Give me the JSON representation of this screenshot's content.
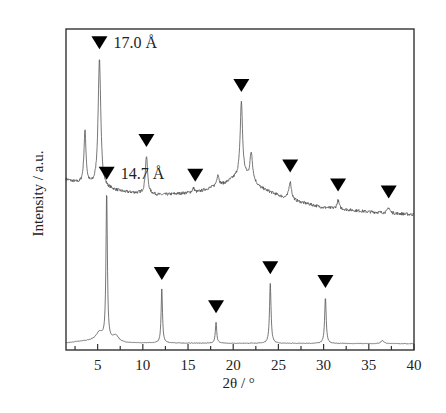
{
  "chart_data": {
    "type": "line",
    "title": "",
    "xlabel": "2θ / °",
    "ylabel": "Intensity / a.u.",
    "xlim": [
      1.5,
      40
    ],
    "x_ticks": [
      5,
      10,
      15,
      20,
      25,
      30,
      35,
      40
    ],
    "x_minor_step": 2.5,
    "y_ticks": [],
    "grid": false,
    "legend": null,
    "marker_symbol": "▼",
    "series": [
      {
        "name": "upper pattern",
        "offset": 1.0,
        "baseline": [
          [
            1.5,
            0.36
          ],
          [
            3,
            0.33
          ],
          [
            8,
            0.27
          ],
          [
            12,
            0.25
          ],
          [
            16,
            0.27
          ],
          [
            19,
            0.33
          ],
          [
            21,
            0.4
          ],
          [
            23,
            0.3
          ],
          [
            26,
            0.22
          ],
          [
            30,
            0.16
          ],
          [
            35,
            0.13
          ],
          [
            40,
            0.11
          ]
        ],
        "peaks": [
          {
            "x": 3.6,
            "height": 0.38,
            "width": 0.28
          },
          {
            "x": 5.2,
            "height": 0.92,
            "width": 0.35
          },
          {
            "x": 10.4,
            "height": 0.27,
            "width": 0.3
          },
          {
            "x": 15.6,
            "height": 0.03,
            "width": 0.3
          },
          {
            "x": 18.3,
            "height": 0.08,
            "width": 0.3
          },
          {
            "x": 20.9,
            "height": 0.52,
            "width": 0.3
          },
          {
            "x": 22.0,
            "height": 0.2,
            "width": 0.35
          },
          {
            "x": 26.3,
            "height": 0.13,
            "width": 0.35
          },
          {
            "x": 31.6,
            "height": 0.06,
            "width": 0.3
          },
          {
            "x": 37.2,
            "height": 0.04,
            "width": 0.3
          }
        ],
        "markers": [
          5.2,
          10.4,
          15.8,
          20.9,
          26.3,
          31.6,
          37.2
        ],
        "annotation": {
          "text": "17.0 Å",
          "x": 5.2
        }
      },
      {
        "name": "lower pattern",
        "offset": 0.0,
        "baseline": [
          [
            1.5,
            0.02
          ],
          [
            3,
            0.03
          ],
          [
            5,
            0.04
          ],
          [
            8,
            0.02
          ],
          [
            40,
            0.015
          ]
        ],
        "peaks": [
          {
            "x": 6.0,
            "height": 1.0,
            "width": 0.18
          },
          {
            "x": 5.2,
            "height": 0.05,
            "width": 0.8
          },
          {
            "x": 7.0,
            "height": 0.04,
            "width": 0.8
          },
          {
            "x": 12.1,
            "height": 0.36,
            "width": 0.18
          },
          {
            "x": 18.1,
            "height": 0.14,
            "width": 0.18
          },
          {
            "x": 24.1,
            "height": 0.4,
            "width": 0.2
          },
          {
            "x": 30.2,
            "height": 0.31,
            "width": 0.2
          },
          {
            "x": 36.5,
            "height": 0.02,
            "width": 0.4
          }
        ],
        "markers": [
          6.0,
          12.1,
          18.1,
          24.1,
          30.2
        ],
        "annotation": {
          "text": "14.7 Å",
          "x": 6.0
        }
      }
    ]
  }
}
